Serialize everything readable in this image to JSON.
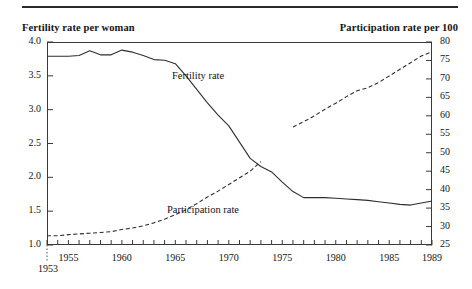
{
  "figure": {
    "left_axis_title": "Fertility rate per woman",
    "right_axis_title": "Participation rate per 100",
    "start_year_note": "1953"
  },
  "labels": {
    "fertility": "Fertility rate",
    "participation": "Participation rate"
  },
  "chart_data": {
    "type": "line",
    "title": "",
    "subtitle": "",
    "xlabel": "",
    "ylabel": "Fertility rate per woman",
    "y2label": "Participation rate per 100",
    "grid": false,
    "legend": "inline-annotations",
    "xlim": [
      1953,
      1989
    ],
    "ylim": [
      1.0,
      4.0
    ],
    "y2lim": [
      25,
      80
    ],
    "xticks": [
      1953,
      1954,
      1955,
      1956,
      1957,
      1958,
      1959,
      1960,
      1961,
      1962,
      1963,
      1964,
      1965,
      1966,
      1967,
      1968,
      1969,
      1970,
      1971,
      1972,
      1973,
      1974,
      1975,
      1976,
      1977,
      1978,
      1979,
      1980,
      1981,
      1982,
      1983,
      1984,
      1985,
      1986,
      1987,
      1988,
      1989
    ],
    "xtick_labels": [
      "1955",
      "1960",
      "1965",
      "1970",
      "1975",
      "1980",
      "1985",
      "1989"
    ],
    "xtick_label_values": [
      1955,
      1960,
      1965,
      1970,
      1975,
      1980,
      1985,
      1989
    ],
    "yticks_left": [
      1.0,
      1.5,
      2.0,
      2.5,
      3.0,
      3.5,
      4.0
    ],
    "ytick_labels_left": [
      "1.0",
      "1.5",
      "2.0",
      "2.5",
      "3.0",
      "3.5",
      "4.0"
    ],
    "yticks_right": [
      25,
      30,
      35,
      40,
      45,
      50,
      55,
      60,
      65,
      70,
      75,
      80
    ],
    "ytick_labels_right": [
      "25",
      "30",
      "35",
      "40",
      "45",
      "50",
      "55",
      "60",
      "65",
      "70",
      "75",
      "80"
    ],
    "series": [
      {
        "name": "Fertility rate",
        "axis": "left",
        "style": "solid",
        "x": [
          1953,
          1954,
          1955,
          1956,
          1957,
          1958,
          1959,
          1960,
          1961,
          1962,
          1963,
          1964,
          1965,
          1966,
          1967,
          1968,
          1969,
          1970,
          1971,
          1972,
          1973,
          1974,
          1975,
          1976,
          1977,
          1978,
          1979,
          1980,
          1981,
          1982,
          1983,
          1984,
          1985,
          1986,
          1987,
          1988,
          1989
        ],
        "values": [
          3.79,
          3.79,
          3.79,
          3.8,
          3.87,
          3.81,
          3.81,
          3.88,
          3.85,
          3.8,
          3.74,
          3.73,
          3.68,
          3.5,
          3.3,
          3.1,
          2.92,
          2.76,
          2.52,
          2.28,
          2.16,
          2.08,
          1.93,
          1.79,
          1.7,
          1.7,
          1.7,
          1.69,
          1.68,
          1.67,
          1.66,
          1.64,
          1.62,
          1.6,
          1.59,
          1.62,
          1.65
        ]
      },
      {
        "name": "Participation rate",
        "axis": "right",
        "style": "dashed",
        "note": "series is drawn in two segments with a break between 1973 and 1976",
        "segments": [
          {
            "x": [
              1953,
              1954,
              1955,
              1956,
              1957,
              1958,
              1959,
              1960,
              1961,
              1962,
              1963,
              1964,
              1965,
              1966,
              1967,
              1968,
              1969,
              1970,
              1971,
              1972,
              1973
            ],
            "values": [
              27.5,
              27.5,
              27.8,
              28.0,
              28.2,
              28.4,
              28.6,
              29.2,
              29.6,
              30.2,
              31.0,
              32.0,
              33.2,
              34.6,
              36.2,
              38.0,
              39.6,
              41.4,
              43.2,
              45.0,
              47.6
            ]
          },
          {
            "x": [
              1976,
              1977,
              1978,
              1979,
              1980,
              1981,
              1982,
              1983,
              1984,
              1985,
              1986,
              1987,
              1988,
              1989
            ],
            "values": [
              57.0,
              58.4,
              60.0,
              61.8,
              63.4,
              65.2,
              66.8,
              67.6,
              69.0,
              70.8,
              72.6,
              74.4,
              76.2,
              77.4
            ]
          }
        ]
      }
    ],
    "annotations": [
      {
        "text": "Fertility rate",
        "x": 1965,
        "y": 3.0
      },
      {
        "text": "Participation rate",
        "x": 1964,
        "y": 1.35
      },
      {
        "text": "1953",
        "x": 1953,
        "y": 1.0,
        "kind": "axis-start-marker"
      }
    ]
  }
}
